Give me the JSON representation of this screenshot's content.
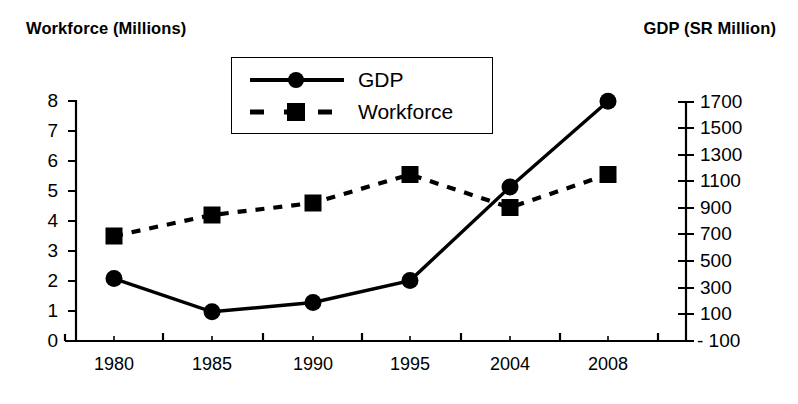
{
  "titles": {
    "left_axis": "Workforce (Millions)",
    "right_axis": "GDP (SR Million)"
  },
  "legend": {
    "gdp": "GDP",
    "workforce": "Workforce"
  },
  "axes": {
    "left_ticks": [
      "8",
      "7",
      "6",
      "5",
      "4",
      "3",
      "2",
      "1",
      "0"
    ],
    "right_ticks": [
      "1700",
      "1500",
      "1300",
      "1100",
      "900",
      "700",
      "500",
      "300",
      "100",
      "- 100"
    ],
    "x_ticks": [
      "1980",
      "1985",
      "1990",
      "1995",
      "2004",
      "2008"
    ]
  },
  "chart_data": {
    "type": "line",
    "title": "",
    "xlabel": "",
    "categories": [
      "1980",
      "1985",
      "1990",
      "1995",
      "2004",
      "2008"
    ],
    "grid": false,
    "legend_position": "top-center",
    "series": [
      {
        "name": "GDP",
        "axis": "right",
        "unit": "SR Million",
        "marker": "circle",
        "line_style": "solid",
        "color": "#000000",
        "values": [
          370,
          120,
          190,
          355,
          1060,
          1705
        ],
        "ylim": [
          -100,
          1700
        ],
        "ytick_step": 200
      },
      {
        "name": "Workforce",
        "axis": "left",
        "unit": "Millions",
        "marker": "square",
        "line_style": "dashed",
        "color": "#000000",
        "values": [
          3.5,
          4.2,
          4.6,
          5.55,
          4.45,
          5.55
        ],
        "ylim": [
          0,
          8
        ],
        "ytick_step": 1
      }
    ]
  }
}
